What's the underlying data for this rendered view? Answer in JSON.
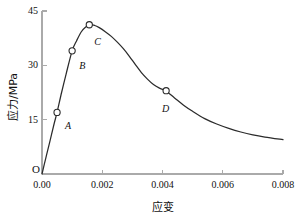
{
  "chart_data": {
    "type": "line",
    "title": "",
    "xlabel": "应变",
    "ylabel": "应力/MPa",
    "xlim": [
      0.0,
      0.008
    ],
    "ylim": [
      0.0,
      45.0
    ],
    "grid": false,
    "legend": "none",
    "origin_marker": "O",
    "xticks": [
      0.0,
      0.002,
      0.004,
      0.006,
      0.008
    ],
    "xtick_labels": [
      "0.00",
      "0.002",
      "0.004",
      "0.006",
      "0.008"
    ],
    "yticks": [
      15,
      30,
      45
    ],
    "ytick_labels": [
      "15",
      "30",
      "45"
    ],
    "series": [
      {
        "name": "stress-strain",
        "color": "#2b2b2b",
        "x": [
          0.0,
          0.00012,
          0.00025,
          0.0004,
          0.0005,
          0.00065,
          0.0008,
          0.001,
          0.00115,
          0.0013,
          0.00145,
          0.0016,
          0.00175,
          0.0019,
          0.0021,
          0.0023,
          0.0025,
          0.0027,
          0.0029,
          0.0031,
          0.0033,
          0.0035,
          0.0037,
          0.0039,
          0.0041,
          0.0044,
          0.0047,
          0.005,
          0.0054,
          0.0058,
          0.0062,
          0.0066,
          0.007,
          0.0074,
          0.008
        ],
        "y": [
          0.0,
          4.2,
          8.6,
          13.8,
          17.0,
          22.5,
          27.6,
          34.0,
          36.8,
          39.2,
          40.6,
          41.2,
          41.0,
          40.4,
          39.3,
          38.0,
          36.4,
          34.6,
          32.5,
          30.2,
          28.0,
          26.2,
          24.7,
          23.7,
          23.0,
          21.0,
          19.0,
          17.3,
          15.3,
          13.8,
          12.6,
          11.6,
          10.8,
          10.2,
          9.5
        ]
      }
    ],
    "points": [
      {
        "label": "A",
        "x": 0.0005,
        "y": 17.0,
        "label_dx": 8,
        "label_dy": 9
      },
      {
        "label": "B",
        "x": 0.001,
        "y": 34.0,
        "label_dx": 7,
        "label_dy": 10
      },
      {
        "label": "C",
        "x": 0.00157,
        "y": 41.2,
        "label_dx": 5,
        "label_dy": 12
      },
      {
        "label": "D",
        "x": 0.00412,
        "y": 23.0,
        "label_dx": -4,
        "label_dy": 13
      }
    ]
  },
  "style": {
    "axis_color": "#aaaaaa",
    "curve_color": "#2b2b2b",
    "marker_edge": "#2b2b2b",
    "marker_fill": "#ffffff",
    "text_color": "#111111",
    "background": "#ffffff"
  }
}
